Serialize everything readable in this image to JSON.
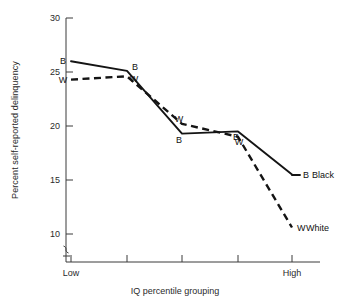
{
  "chart_data": {
    "type": "line",
    "title": "",
    "xlabel": "IQ percentile grouping",
    "ylabel": "Percent self-reported delinquency",
    "x": [
      1,
      2,
      3,
      4,
      5
    ],
    "xtick_labels": [
      "Low",
      "",
      "",
      "",
      "High"
    ],
    "xtick_label_low": "Low",
    "xtick_label_high": "High",
    "ylim": [
      9,
      30
    ],
    "yticks": [
      10,
      15,
      20,
      25,
      30
    ],
    "ytick_labels": [
      "10",
      "15",
      "20",
      "25",
      "30"
    ],
    "y_axis_break": true,
    "grid": false,
    "legend_position": "right-inline",
    "series": [
      {
        "name": "Black",
        "legend_marker": "B",
        "legend_text": "Black",
        "point_labels": [
          "B",
          "B",
          "B",
          "B",
          "B"
        ],
        "linestyle": "solid",
        "values": [
          26.0,
          25.1,
          19.3,
          19.5,
          15.5
        ]
      },
      {
        "name": "White",
        "legend_marker": "W",
        "legend_text": "White",
        "point_labels": [
          "W",
          "W",
          "W",
          "W",
          "W"
        ],
        "linestyle": "dashed",
        "values": [
          24.3,
          24.6,
          20.2,
          19.0,
          10.6
        ]
      }
    ]
  }
}
